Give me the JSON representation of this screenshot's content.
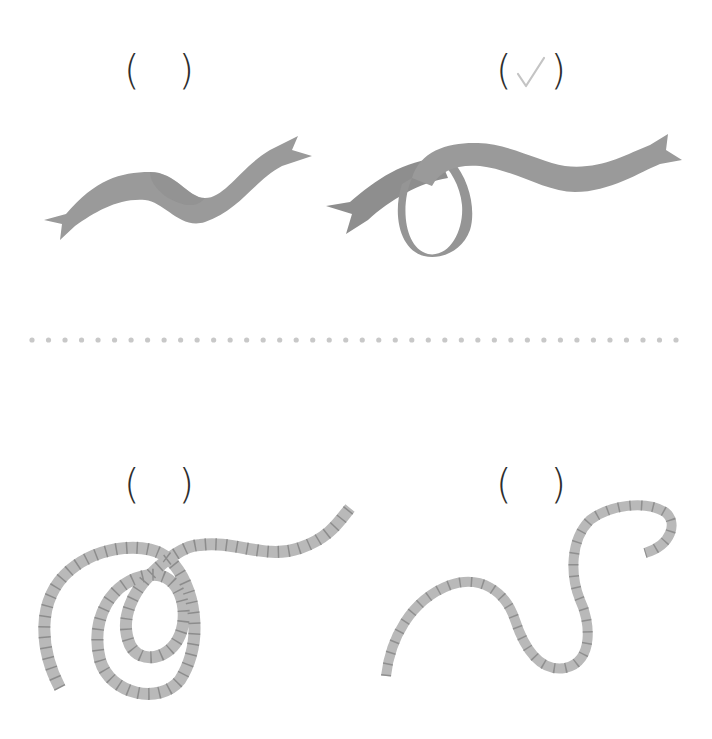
{
  "items": [
    {
      "id": "ribbon-wavy",
      "answer": {
        "open": "(",
        "close": ")",
        "checked": false
      }
    },
    {
      "id": "ribbon-looped",
      "answer": {
        "open": "(",
        "close": ")",
        "checked": true,
        "mark": "✓"
      }
    },
    {
      "id": "rope-coiled",
      "answer": {
        "open": "(",
        "close": ")",
        "checked": false
      }
    },
    {
      "id": "rope-curved",
      "answer": {
        "open": "(",
        "close": ")",
        "checked": false
      }
    }
  ],
  "colors": {
    "ribbon": "#9a9a9a",
    "ribbon_shade": "#858585",
    "rope": "#b9b9b9",
    "rope_stripe": "#7d7d7d",
    "paren": "#2e2e2e",
    "check": "#c4c4c4",
    "dots": "#c8c8c8"
  },
  "divider": {
    "dot_count": 40,
    "start_x": 32,
    "end_x": 676,
    "y": 340
  }
}
